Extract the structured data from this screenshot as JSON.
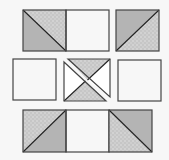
{
  "diagram": {
    "colors": {
      "background": "#f7f7f7",
      "white_fabric": "#ffffff",
      "solid_gray_fabric": "#b4b4b4",
      "dotted_gray_fabric": "#c6c6c6",
      "dot_color": "#e2e2e2",
      "outline": "#444444"
    },
    "rows": [
      {
        "name": "top-row",
        "units": [
          {
            "type": "half-square-triangle",
            "diagonal": "top-left-to-bottom-right",
            "upper_right": "dotted",
            "lower_left": "solid"
          },
          {
            "type": "plain-square",
            "fabric": "white"
          },
          {
            "type": "half-square-triangle",
            "diagonal": "bottom-left-to-top-right",
            "upper_left": "solid",
            "lower_right": "dotted"
          }
        ]
      },
      {
        "name": "middle-row",
        "units": [
          {
            "type": "plain-square",
            "fabric": "white"
          },
          {
            "type": "quarter-square-triangle-split",
            "top": "dotted",
            "bottom": "dotted",
            "left": "white",
            "right": "white",
            "split": "top-left-to-bottom-right"
          },
          {
            "type": "plain-square",
            "fabric": "white"
          }
        ]
      },
      {
        "name": "bottom-row",
        "units": [
          {
            "type": "half-square-triangle",
            "diagonal": "bottom-left-to-top-right",
            "upper_left": "dotted",
            "lower_right": "solid"
          },
          {
            "type": "plain-square",
            "fabric": "white"
          },
          {
            "type": "half-square-triangle",
            "diagonal": "top-left-to-bottom-right",
            "upper_right": "solid",
            "lower_left": "dotted"
          }
        ]
      }
    ]
  }
}
